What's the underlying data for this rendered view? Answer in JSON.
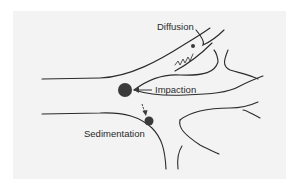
{
  "diagram": {
    "type": "airway particle deposition mechanisms",
    "labels": {
      "diffusion": "Diffusion",
      "impaction": "Impaction",
      "sedimentation": "Sedimentation"
    },
    "colors": {
      "background_panel": "#f3f3f3",
      "airway_wall": "#2b2b2b",
      "particle": "#3a3a3a",
      "label_text": "#2a2a2a"
    },
    "particles": [
      {
        "mechanism": "impaction",
        "size": "large"
      },
      {
        "mechanism": "sedimentation",
        "size": "medium"
      },
      {
        "mechanism": "diffusion",
        "size": "small"
      }
    ]
  }
}
